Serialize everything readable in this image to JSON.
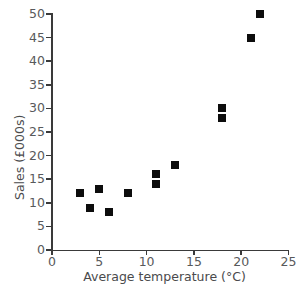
{
  "chart_data": {
    "type": "scatter",
    "title": "",
    "xlabel": "Average temperature (°C)",
    "ylabel": "Sales (£000s)",
    "xlim": [
      0,
      25
    ],
    "ylim": [
      0,
      50
    ],
    "xticks": [
      0,
      5,
      10,
      15,
      20,
      25
    ],
    "yticks": [
      0,
      5,
      10,
      15,
      20,
      25,
      30,
      35,
      40,
      45,
      50
    ],
    "xtick_labels": [
      "0",
      "5",
      "10",
      "15",
      "20",
      "25"
    ],
    "ytick_labels": [
      "0",
      "5",
      "10",
      "15",
      "20",
      "25",
      "30",
      "35",
      "40",
      "45",
      "50"
    ],
    "grid": false,
    "legend": null,
    "marker": "square",
    "marker_color": "#0d0d0d",
    "points": [
      {
        "x": 3,
        "y": 12
      },
      {
        "x": 4,
        "y": 9
      },
      {
        "x": 5,
        "y": 13
      },
      {
        "x": 6,
        "y": 8
      },
      {
        "x": 8,
        "y": 12
      },
      {
        "x": 11,
        "y": 16
      },
      {
        "x": 11,
        "y": 14
      },
      {
        "x": 13,
        "y": 18
      },
      {
        "x": 18,
        "y": 30
      },
      {
        "x": 18,
        "y": 28
      },
      {
        "x": 21,
        "y": 45
      },
      {
        "x": 22,
        "y": 50
      }
    ]
  },
  "style": {
    "background": "#ffffff",
    "axis_color": "#3a3a3a",
    "tick_label_color": "#58595b",
    "axis_title_color": "#4a4a4c"
  },
  "cropped_title_fragment": ""
}
